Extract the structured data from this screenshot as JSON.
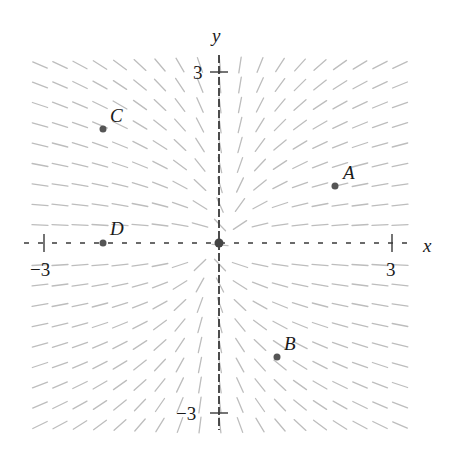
{
  "figure": {
    "type": "slope_field",
    "axes": {
      "x_label": "x",
      "y_label": "y",
      "x_ticks": [
        {
          "value": -3,
          "label": "−3"
        },
        {
          "value": 3,
          "label": "3"
        }
      ],
      "y_ticks": [
        {
          "value": 3,
          "label": "3"
        },
        {
          "value": -3,
          "label": "−3"
        }
      ],
      "x_range": [
        -3.2,
        3.2
      ],
      "y_range": [
        -3.2,
        3.2
      ]
    },
    "points": [
      {
        "label": "A",
        "x": 2,
        "y": 1
      },
      {
        "label": "B",
        "x": 1,
        "y": -2
      },
      {
        "label": "C",
        "x": -2,
        "y": 2
      },
      {
        "label": "D",
        "x": -2,
        "y": 0
      }
    ],
    "origin_marker": true,
    "colors": {
      "segments": "#bdbdbd",
      "axes": "#3a3a3a",
      "points": "#555555",
      "text": "#1a1a1a"
    }
  },
  "labels": {
    "x_axis": "x",
    "y_axis": "y",
    "x_tick_neg": "−3",
    "x_tick_pos": "3",
    "y_tick_pos": "3",
    "y_tick_neg": "−3",
    "point_A": "A",
    "point_B": "B",
    "point_C": "C",
    "point_D": "D"
  }
}
